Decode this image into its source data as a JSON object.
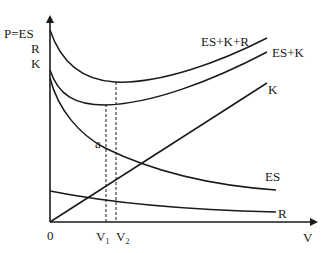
{
  "diagram": {
    "axes": {
      "y_label_lines": [
        "P=ES",
        "R",
        "K"
      ],
      "x_label": "V",
      "origin_label": "0"
    },
    "curves": [
      {
        "id": "es_k_r",
        "label": "ES+K+R"
      },
      {
        "id": "es_k",
        "label": "ES+K"
      },
      {
        "id": "k",
        "label": "K"
      },
      {
        "id": "es",
        "label": "ES"
      },
      {
        "id": "r",
        "label": "R"
      }
    ],
    "markers": {
      "point_a": "a",
      "v1": {
        "main": "V",
        "sub": "1"
      },
      "v2": {
        "main": "V",
        "sub": "2"
      }
    },
    "colors": {
      "line": "#1a1a1a",
      "background": "#ffffff"
    }
  }
}
